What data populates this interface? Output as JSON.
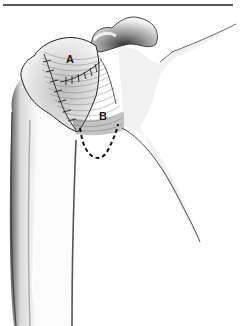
{
  "figure": {
    "type": "medical-illustration",
    "labels": [
      {
        "id": "A",
        "text": "A"
      },
      {
        "id": "B",
        "text": "B"
      }
    ],
    "colors": {
      "line": "#1a1a1a",
      "shade": "#6b6b6b",
      "background": "#ffffff"
    }
  }
}
